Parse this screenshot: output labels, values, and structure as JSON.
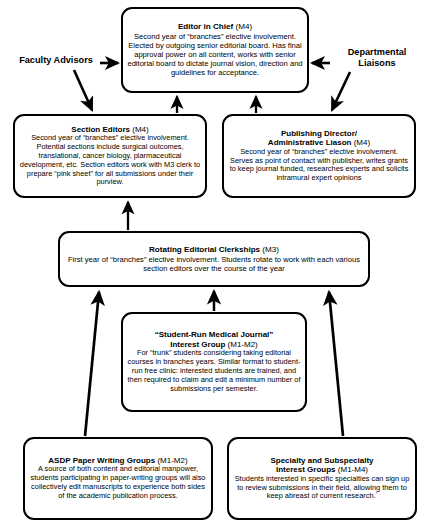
{
  "diagram": {
    "type": "flowchart",
    "colors": {
      "stroke": "#000000",
      "background": "#ffffff",
      "text": "#000000"
    }
  },
  "side_labels": {
    "faculty_advisors": "Faculty Advisors",
    "departmental_liaisons": "Departmental Liaisons"
  },
  "nodes": {
    "editor_in_chief": {
      "title": "Editor in Chief",
      "year": "(M4)",
      "body": "Second year of “branches” elective involvement. Elected by outgoing senior editorial board. Has final approval power on all content, works with senior editorial  board to dictate journal vision, direction and guidelines for acceptance."
    },
    "section_editors": {
      "title": "Section Editors",
      "year": "(M4)",
      "body": "Second year of “branches” elective involvement. Potential sections include surgical outcomes, translational, cancer biology, plarmaceutical development, etc. Section editors work with M3 clerk to prepare “pink sheet” for all submissions under their purview."
    },
    "publishing_director": {
      "title": "Publishing Director/ Administrative Liason",
      "title_line1": "Publishing Director/",
      "title_line2": "Administrative Liason",
      "year": "(M4)",
      "body": "Second year of “branches” elective involvement. Serves as point of contact with publisher, writes grants to keep journal funded, researches experts and solicits intramural expert opinions"
    },
    "clerkships": {
      "title": "Rotating Editorial Clerkships",
      "year": "(M3)",
      "body": "First year of “branches” elective involvement. Students rotate to work with each various section editors over the course of the year"
    },
    "interest_group": {
      "title_line1": "“Student-Run Medical Journal”",
      "title_line2": "Interest Group",
      "year": "(M1-M2)",
      "body": "For “trunk” students considering taking editorial courses in branches years. Similar format to student-run free clinic: interested students are trained, and then required to claim and edit a minimum number of submissions per semester."
    },
    "asdp_paper_writing": {
      "title": "ASDP Paper Writing Groups",
      "year": "(M1-M2)",
      "body": "A source of both content and editorial manpower, students participating in paper-writing groups will also collectively edit manuscripts to experience both sides of the academic publication process."
    },
    "specialty_groups": {
      "title_line1": "Specialty and Subspecialty",
      "title_line2": "Interest Groups",
      "year": "(M1-M4)",
      "body": "Students interested in specific specialties can sign up to review submissions in their field, allowing them to keep abreast of current research.ʼ"
    }
  },
  "edges": [
    {
      "name": "section-editors-to-editor-in-chief",
      "from": "section_editors",
      "to": "editor_in_chief"
    },
    {
      "name": "publishing-director-to-editor-in-chief",
      "from": "publishing_director",
      "to": "editor_in_chief"
    },
    {
      "name": "clerkships-to-section-editors",
      "from": "clerkships",
      "to": "section_editors"
    },
    {
      "name": "interest-group-to-clerkships",
      "from": "interest_group",
      "to": "clerkships"
    },
    {
      "name": "asdp-to-clerkships",
      "from": "asdp_paper_writing",
      "to": "clerkships"
    },
    {
      "name": "specialty-to-clerkships",
      "from": "specialty_groups",
      "to": "clerkships"
    },
    {
      "name": "faculty-advisors-to-editor-in-chief",
      "from": "faculty_advisors",
      "to": "editor_in_chief"
    },
    {
      "name": "faculty-advisors-to-section-editors",
      "from": "faculty_advisors",
      "to": "section_editors"
    },
    {
      "name": "departmental-liaisons-to-editor-in-chief",
      "from": "departmental_liaisons",
      "to": "editor_in_chief"
    },
    {
      "name": "departmental-liaisons-to-publishing-director",
      "from": "departmental_liaisons",
      "to": "publishing_director"
    }
  ]
}
